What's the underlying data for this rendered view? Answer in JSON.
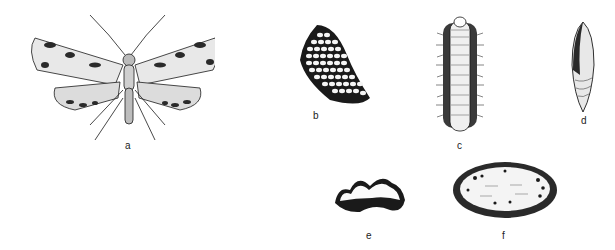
{
  "figure": {
    "panels": [
      {
        "id": "a",
        "label": "a",
        "subject": "adult moth (dorsal view, wings spread)"
      },
      {
        "id": "b",
        "label": "b",
        "subject": "egg mass"
      },
      {
        "id": "c",
        "label": "c",
        "subject": "hairy larva"
      },
      {
        "id": "d",
        "label": "d",
        "subject": "pupa"
      },
      {
        "id": "e",
        "label": "e",
        "subject": "cocoon (side view)"
      },
      {
        "id": "f",
        "label": "f",
        "subject": "cocoon (top view)"
      }
    ],
    "colors": {
      "ink": "#1a1a1a",
      "paper": "#ffffff"
    }
  }
}
